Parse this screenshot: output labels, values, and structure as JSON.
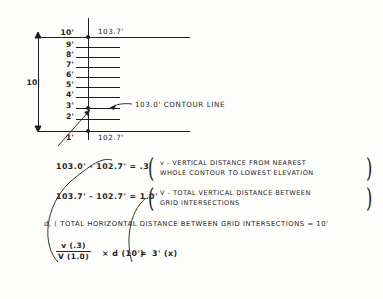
{
  "diagram": {
    "title_note": "contour interpolation between grid intersections",
    "top_elevation_label": "103.7'",
    "bottom_elevation_label": "102.7'",
    "dimension_label": "10'",
    "contour_callout": "103.0' CONTOUR LINE",
    "tick_labels": [
      "10'",
      "9'",
      "8'",
      "7'",
      "6'",
      "5'",
      "4'",
      "3'",
      "2'",
      "1'"
    ],
    "contour_tick_index": 7
  },
  "equations": {
    "line1": {
      "expression": "103.0' - 102.7' = .3'",
      "note_line1": "v - VERTICAL DISTANCE FROM NEAREST",
      "note_line2": "WHOLE CONTOUR TO LOWEST ELEVATION"
    },
    "line2": {
      "expression": "103.7' - 102.7' = 1.0'",
      "note_line1": "V - TOTAL VERTICAL DISTANCE BETWEEN",
      "note_line2": "GRID INTERSECTIONS"
    },
    "line3": {
      "expression": "d, ( TOTAL HORIZONTAL DISTANCE BETWEEN GRID INTERSECTIONS = 10'"
    },
    "formula": {
      "numerator": "v (.3)",
      "denominator": "V (1.0)",
      "multiplier": "× d (10')",
      "equals": "=",
      "result": "3' (x)"
    }
  },
  "colors": {
    "ink": "#242424",
    "paper": "#fdfdfc"
  }
}
